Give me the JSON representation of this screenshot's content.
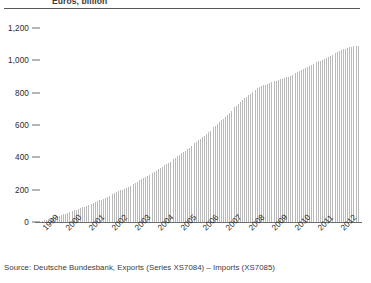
{
  "header": {
    "title": "Euros, billion"
  },
  "source": {
    "text": "Source: Deutsche Bundesbank, Exports (Series XS7084) – Imports (XS7085)"
  },
  "colors": {
    "bar": "#b9b9b9",
    "axis": "#6d6d6d",
    "rule": "#58585a",
    "text": "#2b2b2b",
    "background": "#ffffff"
  },
  "chart_data": {
    "type": "bar",
    "title": "Euros, billion",
    "subtitle": "",
    "xlabel": "",
    "ylabel": "Euros, billion",
    "ylim": [
      0,
      1200
    ],
    "yticks": [
      0,
      200,
      400,
      600,
      800,
      1000,
      1200
    ],
    "ytick_labels": [
      "0",
      "200",
      "400",
      "600",
      "800",
      "1,000",
      "1,200"
    ],
    "xtick_labels": [
      "1999",
      "2000",
      "2001",
      "2002",
      "2003",
      "2004",
      "2005",
      "2006",
      "2007",
      "2008",
      "2009",
      "2010",
      "2011",
      "2012"
    ],
    "grid": false,
    "legend": null,
    "categories": [
      "1999-01",
      "1999-02",
      "1999-03",
      "1999-04",
      "1999-05",
      "1999-06",
      "1999-07",
      "1999-08",
      "1999-09",
      "1999-10",
      "1999-11",
      "1999-12",
      "2000-01",
      "2000-02",
      "2000-03",
      "2000-04",
      "2000-05",
      "2000-06",
      "2000-07",
      "2000-08",
      "2000-09",
      "2000-10",
      "2000-11",
      "2000-12",
      "2001-01",
      "2001-02",
      "2001-03",
      "2001-04",
      "2001-05",
      "2001-06",
      "2001-07",
      "2001-08",
      "2001-09",
      "2001-10",
      "2001-11",
      "2001-12",
      "2002-01",
      "2002-02",
      "2002-03",
      "2002-04",
      "2002-05",
      "2002-06",
      "2002-07",
      "2002-08",
      "2002-09",
      "2002-10",
      "2002-11",
      "2002-12",
      "2003-01",
      "2003-02",
      "2003-03",
      "2003-04",
      "2003-05",
      "2003-06",
      "2003-07",
      "2003-08",
      "2003-09",
      "2003-10",
      "2003-11",
      "2003-12",
      "2004-01",
      "2004-02",
      "2004-03",
      "2004-04",
      "2004-05",
      "2004-06",
      "2004-07",
      "2004-08",
      "2004-09",
      "2004-10",
      "2004-11",
      "2004-12",
      "2005-01",
      "2005-02",
      "2005-03",
      "2005-04",
      "2005-05",
      "2005-06",
      "2005-07",
      "2005-08",
      "2005-09",
      "2005-10",
      "2005-11",
      "2005-12",
      "2006-01",
      "2006-02",
      "2006-03",
      "2006-04",
      "2006-05",
      "2006-06",
      "2006-07",
      "2006-08",
      "2006-09",
      "2006-10",
      "2006-11",
      "2006-12",
      "2007-01",
      "2007-02",
      "2007-03",
      "2007-04",
      "2007-05",
      "2007-06",
      "2007-07",
      "2007-08",
      "2007-09",
      "2007-10",
      "2007-11",
      "2007-12",
      "2008-01",
      "2008-02",
      "2008-03",
      "2008-04",
      "2008-05",
      "2008-06",
      "2008-07",
      "2008-08",
      "2008-09",
      "2008-10",
      "2008-11",
      "2008-12",
      "2009-01",
      "2009-02",
      "2009-03",
      "2009-04",
      "2009-05",
      "2009-06",
      "2009-07",
      "2009-08",
      "2009-09",
      "2009-10",
      "2009-11",
      "2009-12",
      "2010-01",
      "2010-02",
      "2010-03",
      "2010-04",
      "2010-05",
      "2010-06",
      "2010-07",
      "2010-08",
      "2010-09",
      "2010-10",
      "2010-11",
      "2010-12",
      "2011-01",
      "2011-02",
      "2011-03",
      "2011-04",
      "2011-05",
      "2011-06",
      "2011-07",
      "2011-08",
      "2011-09",
      "2011-10",
      "2011-11",
      "2011-12",
      "2012-01",
      "2012-02",
      "2012-03",
      "2012-04",
      "2012-05",
      "2012-06",
      "2012-07",
      "2012-08",
      "2012-09",
      "2012-10",
      "2012-11",
      "2012-12"
    ],
    "values": [
      3,
      6,
      10,
      13,
      17,
      21,
      25,
      28,
      32,
      36,
      40,
      44,
      48,
      52,
      56,
      60,
      64,
      69,
      73,
      77,
      82,
      86,
      91,
      95,
      100,
      104,
      109,
      114,
      119,
      124,
      129,
      134,
      139,
      144,
      149,
      154,
      160,
      165,
      171,
      177,
      183,
      189,
      195,
      201,
      207,
      213,
      219,
      225,
      231,
      237,
      244,
      250,
      257,
      263,
      270,
      276,
      283,
      290,
      296,
      303,
      311,
      318,
      326,
      334,
      342,
      350,
      358,
      366,
      374,
      382,
      390,
      398,
      407,
      415,
      424,
      433,
      442,
      451,
      460,
      469,
      478,
      487,
      496,
      505,
      515,
      525,
      535,
      545,
      555,
      565,
      576,
      586,
      597,
      607,
      618,
      628,
      640,
      651,
      663,
      674,
      686,
      697,
      709,
      720,
      732,
      743,
      754,
      765,
      775,
      785,
      794,
      803,
      811,
      819,
      826,
      833,
      839,
      845,
      850,
      855,
      859,
      863,
      867,
      871,
      875,
      879,
      883,
      887,
      891,
      896,
      900,
      905,
      910,
      916,
      921,
      927,
      933,
      939,
      945,
      951,
      957,
      963,
      969,
      975,
      981,
      987,
      993,
      999,
      1005,
      1011,
      1017,
      1023,
      1029,
      1035,
      1041,
      1047,
      1053,
      1058,
      1063,
      1068,
      1072,
      1076,
      1080,
      1083,
      1086,
      1088,
      1089,
      1090
    ]
  }
}
